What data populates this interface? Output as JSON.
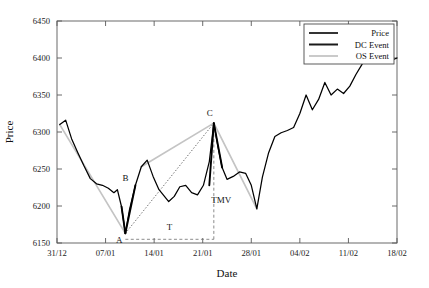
{
  "chart_data": {
    "type": "line",
    "title": "",
    "xlabel": "Date",
    "ylabel": "Price",
    "xlim": [
      0,
      49
    ],
    "ylim": [
      6150,
      6450
    ],
    "grid": false,
    "xticklabels": [
      "31/12",
      "07/01",
      "14/01",
      "21/01",
      "28/01",
      "04/02",
      "11/02",
      "18/02"
    ],
    "xtickvalues": [
      0,
      7,
      14,
      21,
      28,
      35,
      42,
      49
    ],
    "yticklabels": [
      "6150",
      "6200",
      "6250",
      "6300",
      "6350",
      "6400",
      "6450"
    ],
    "ytickvalues": [
      6150,
      6200,
      6250,
      6300,
      6350,
      6400,
      6450
    ],
    "legend": {
      "position": "upper-right",
      "entries": [
        {
          "name": "Price",
          "color": "#000000",
          "width": 1.6
        },
        {
          "name": "DC Event",
          "color": "#1a1a1a",
          "width": 2.0
        },
        {
          "name": "OS Event",
          "color": "#bdbdbd",
          "width": 1.6
        }
      ]
    },
    "series": [
      {
        "name": "Price",
        "color": "#000000",
        "x": [
          0.4,
          1.25,
          2.1,
          3.0,
          3.9,
          4.8,
          5.7,
          6.55,
          7.4,
          8.2,
          8.7,
          9.3,
          9.85,
          10.45,
          11.3,
          12.15,
          13.0,
          13.85,
          14.7,
          15.4,
          16.1,
          16.9,
          17.7,
          18.55,
          19.4,
          20.25,
          21.1,
          21.95,
          22.6,
          23.2,
          23.8,
          24.5,
          25.4,
          26.3,
          27.2,
          28.0,
          28.8,
          29.6,
          30.5,
          31.4,
          32.3,
          33.2,
          34.1,
          35.0,
          35.9,
          36.8,
          37.7,
          38.6,
          39.5,
          40.4,
          41.3,
          42.2,
          43.1,
          44.0,
          44.9,
          45.8,
          46.7,
          47.6,
          48.5,
          49.0
        ],
        "y": [
          6310,
          6316,
          6291,
          6272,
          6254,
          6237,
          6230,
          6228,
          6224,
          6218,
          6222,
          6199,
          6163,
          6195,
          6228,
          6253,
          6262,
          6240,
          6222,
          6214,
          6206,
          6213,
          6226,
          6228,
          6218,
          6215,
          6228,
          6260,
          6312,
          6280,
          6252,
          6236,
          6240,
          6246,
          6244,
          6228,
          6196,
          6239,
          6272,
          6294,
          6299,
          6302,
          6306,
          6325,
          6350,
          6330,
          6344,
          6367,
          6350,
          6358,
          6352,
          6362,
          6378,
          6392,
          6400,
          6402,
          6398,
          6400,
          6398,
          6400
        ]
      }
    ],
    "os_segments": [
      {
        "name": "os-downtrend",
        "color": "#c4c4c4",
        "x": [
          0.4,
          9.85
        ],
        "y": [
          6310,
          6163
        ]
      },
      {
        "name": "os-uptrend",
        "color": "#c4c4c4",
        "x": [
          12.15,
          22.6
        ],
        "y": [
          6253,
          6312
        ]
      },
      {
        "name": "os-downtrend-2",
        "color": "#c4c4c4",
        "x": [
          22.6,
          28.8
        ],
        "y": [
          6312,
          6196
        ]
      }
    ],
    "dc_segments": [
      {
        "name": "dc-down",
        "color": "#000000",
        "x": [
          9.3,
          9.85
        ],
        "y": [
          6199,
          6163
        ]
      },
      {
        "name": "dc-up",
        "color": "#000000",
        "x": [
          9.85,
          11.3
        ],
        "y": [
          6163,
          6228
        ]
      },
      {
        "name": "dc-peak",
        "color": "#000000",
        "x": [
          21.95,
          22.6
        ],
        "y": [
          6228,
          6312
        ]
      },
      {
        "name": "dc-drop",
        "color": "#000000",
        "x": [
          22.6,
          23.8
        ],
        "y": [
          6312,
          6252
        ]
      }
    ],
    "guide_lines": [
      {
        "name": "tmv-diagonal-A-to-C",
        "style": "dotted",
        "color": "#555555",
        "x": [
          9.85,
          22.6
        ],
        "y": [
          6163,
          6312
        ]
      },
      {
        "name": "time-interval-baseline",
        "style": "dashed",
        "color": "#777777",
        "x": [
          9.85,
          22.6
        ],
        "y": [
          6155,
          6155
        ]
      },
      {
        "name": "time-interval-vertical",
        "style": "dashed",
        "color": "#777777",
        "x": [
          22.6,
          22.6
        ],
        "y": [
          6155,
          6312
        ]
      }
    ],
    "annotations": [
      {
        "label": "A",
        "x": 9.85,
        "y": 6163,
        "dx": -6,
        "dy": 10,
        "name": "annotation-A"
      },
      {
        "label": "B",
        "x": 11.3,
        "y": 6228,
        "dx": -10,
        "dy": -4,
        "name": "annotation-B"
      },
      {
        "label": "C",
        "x": 22.6,
        "y": 6312,
        "dx": -4,
        "dy": -7,
        "name": "annotation-C"
      },
      {
        "label": "TMV",
        "x": 23.4,
        "y": 6209,
        "dx": 2,
        "dy": 4,
        "name": "annotation-TMV"
      },
      {
        "label": "T",
        "x": 16.2,
        "y": 6168,
        "dx": 0,
        "dy": 0,
        "name": "annotation-T"
      }
    ]
  }
}
